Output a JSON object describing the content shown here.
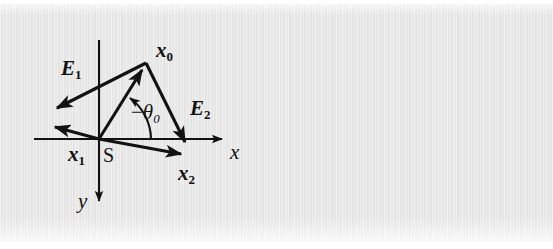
{
  "figure": {
    "kind": "vector-diagram",
    "background_color": "#e9e9e9",
    "ink_color": "#121212"
  },
  "axes": {
    "x_label": "x",
    "y_label": "y",
    "origin_label": "S",
    "x_axis": {
      "x1": 34,
      "y1": 139,
      "x2": 230,
      "y2": 139,
      "arrow_at": "end"
    },
    "y_axis": {
      "x1": 99,
      "y1": 40,
      "x2": 99,
      "y2": 209,
      "arrow_at": "end"
    }
  },
  "points": {
    "origin": {
      "x": 99,
      "y": 139
    },
    "x0": {
      "x": 146,
      "y": 63
    },
    "x1": {
      "x": 47,
      "y": 125
    },
    "x2": {
      "x": 189,
      "y": 156
    }
  },
  "vectors": [
    {
      "name": "x0",
      "label": "x",
      "subscript": "0",
      "from": {
        "x": 99,
        "y": 139
      },
      "to": {
        "x": 146,
        "y": 63
      },
      "label_pos": {
        "x": 158,
        "y": 42
      }
    },
    {
      "name": "x1",
      "label": "x",
      "subscript": "1",
      "from": {
        "x": 99,
        "y": 139
      },
      "to": {
        "x": 47,
        "y": 125
      },
      "label_pos": {
        "x": 68,
        "y": 144
      }
    },
    {
      "name": "x2",
      "label": "x",
      "subscript": "2",
      "from": {
        "x": 99,
        "y": 139
      },
      "to": {
        "x": 189,
        "y": 156
      },
      "label_pos": {
        "x": 178,
        "y": 163
      }
    },
    {
      "name": "E1",
      "label": "E",
      "subscript": "1",
      "from": {
        "x": 146,
        "y": 63
      },
      "to": {
        "x": 47,
        "y": 113
      },
      "label_pos": {
        "x": 60,
        "y": 58
      }
    },
    {
      "name": "E2",
      "label": "E",
      "subscript": "2",
      "from": {
        "x": 146,
        "y": 63
      },
      "to": {
        "x": 190,
        "y": 152
      },
      "label_pos": {
        "x": 190,
        "y": 97
      }
    }
  ],
  "angle": {
    "label_minus": "−",
    "label_theta": "θ",
    "subscript": "0",
    "label_pos": {
      "x": 134,
      "y": 103
    },
    "arc": {
      "center": {
        "x": 99,
        "y": 139
      },
      "radius": 52,
      "start_deg": 0,
      "end_deg": 58
    }
  }
}
